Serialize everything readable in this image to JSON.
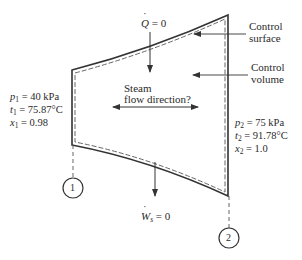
{
  "diagram": {
    "type": "control-volume-schematic",
    "heat": {
      "symbol": "Q",
      "equals": "= 0"
    },
    "work": {
      "symbol": "W",
      "subscript": "s",
      "equals": "= 0"
    },
    "flow_label": {
      "line1": "Steam",
      "line2": "flow direction?"
    },
    "callouts": {
      "control_surface": {
        "line1": "Control",
        "line2": "surface"
      },
      "control_volume": {
        "line1": "Control",
        "line2": "volume"
      }
    },
    "state1": {
      "marker": "1",
      "pressure": {
        "var": "p",
        "sub": "1",
        "value": "= 40 kPa"
      },
      "temperature": {
        "var": "t",
        "sub": "1",
        "value": "= 75.87°C"
      },
      "quality": {
        "var": "x",
        "sub": "1",
        "value": "= 0.98"
      }
    },
    "state2": {
      "marker": "2",
      "pressure": {
        "var": "p",
        "sub": "2",
        "value": "= 75 kPa"
      },
      "temperature": {
        "var": "t",
        "sub": "2",
        "value": "= 91.78°C"
      },
      "quality": {
        "var": "x",
        "sub": "2",
        "value": "= 1.0"
      }
    },
    "colors": {
      "line": "#333333",
      "dash": "#555555",
      "text": "#2a2a2a",
      "background": "#ffffff"
    }
  }
}
